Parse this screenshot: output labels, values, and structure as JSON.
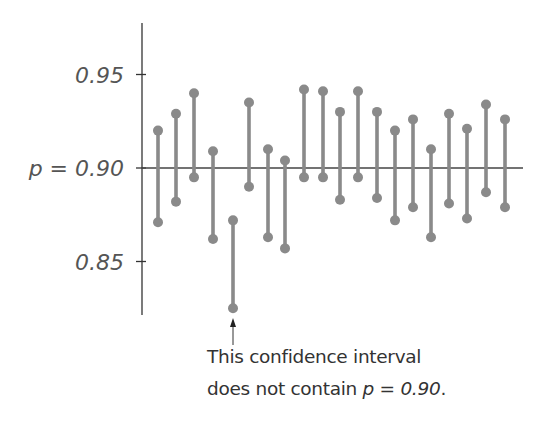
{
  "chart_data": {
    "type": "interval",
    "title": "",
    "xlabel": "",
    "ylabel": "",
    "ylim": [
      0.815,
      0.978
    ],
    "grid": false,
    "y_ticks": [
      {
        "value": 0.95,
        "label": "0.95"
      },
      {
        "value": 0.9,
        "label": "p = 0.90"
      },
      {
        "value": 0.85,
        "label": "0.85"
      }
    ],
    "reference_line": {
      "value": 0.9,
      "label": "p = 0.90"
    },
    "intervals": [
      {
        "index": 1,
        "lower": 0.871,
        "upper": 0.92
      },
      {
        "index": 2,
        "lower": 0.882,
        "upper": 0.929
      },
      {
        "index": 3,
        "lower": 0.895,
        "upper": 0.94
      },
      {
        "index": 4,
        "lower": 0.862,
        "upper": 0.909
      },
      {
        "index": 5,
        "lower": 0.825,
        "upper": 0.872
      },
      {
        "index": 6,
        "lower": 0.89,
        "upper": 0.935
      },
      {
        "index": 7,
        "lower": 0.863,
        "upper": 0.91
      },
      {
        "index": 8,
        "lower": 0.857,
        "upper": 0.904
      },
      {
        "index": 9,
        "lower": 0.895,
        "upper": 0.942
      },
      {
        "index": 10,
        "lower": 0.895,
        "upper": 0.941
      },
      {
        "index": 11,
        "lower": 0.883,
        "upper": 0.93
      },
      {
        "index": 12,
        "lower": 0.895,
        "upper": 0.941
      },
      {
        "index": 13,
        "lower": 0.884,
        "upper": 0.93
      },
      {
        "index": 14,
        "lower": 0.872,
        "upper": 0.92
      },
      {
        "index": 15,
        "lower": 0.879,
        "upper": 0.926
      },
      {
        "index": 16,
        "lower": 0.863,
        "upper": 0.91
      },
      {
        "index": 17,
        "lower": 0.881,
        "upper": 0.929
      },
      {
        "index": 18,
        "lower": 0.873,
        "upper": 0.921
      },
      {
        "index": 19,
        "lower": 0.887,
        "upper": 0.934
      },
      {
        "index": 20,
        "lower": 0.879,
        "upper": 0.926
      }
    ],
    "annotations": [
      {
        "target_index": 5,
        "text": "This confidence interval does not contain p = 0.90."
      }
    ],
    "colors": {
      "interval": "#8a8a8a",
      "axis": "#333333",
      "reference_line": "#444444",
      "text": "#555555"
    }
  },
  "annotation": {
    "line1": "This confidence interval",
    "line2_prefix": "does not contain ",
    "line2_math": "p = 0.90",
    "line2_suffix": "."
  }
}
